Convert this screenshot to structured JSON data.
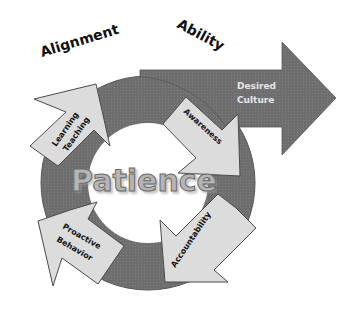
{
  "diagram": {
    "top_labels": {
      "left": "Alignment",
      "right": "Ability"
    },
    "goal_arrow": {
      "line1": "Desired",
      "line2": "Culture"
    },
    "center": "Patience",
    "cycle_arrows": [
      {
        "id": "learning-teaching",
        "line1": "Learning",
        "line2": "Teaching"
      },
      {
        "id": "awareness",
        "line1": "Awareness"
      },
      {
        "id": "accountability",
        "line1": "Accountability"
      },
      {
        "id": "proactive-behavior",
        "line1": "Proactive",
        "line2": "Behavior"
      }
    ],
    "colors": {
      "ring": "#6e6e6e",
      "ring_edge": "#555555",
      "arrow_fill": "#dcdcdc",
      "arrow_stroke": "#4a4a4a",
      "goal_arrow": "#6e6e6e",
      "center_text": "#b5b5b5"
    }
  }
}
